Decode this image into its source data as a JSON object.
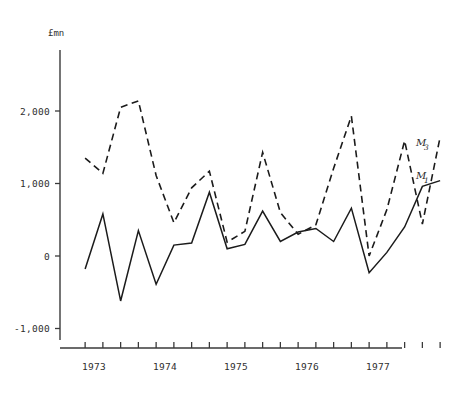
{
  "chart_data": {
    "type": "line",
    "title": "",
    "xlabel": "",
    "ylabel": "£mn",
    "unit_label": "£mn",
    "grid": false,
    "legend_position": "right-inline",
    "ylim": [
      -1000,
      2750
    ],
    "yticks": [
      -1000,
      0,
      1000,
      2000
    ],
    "ytick_labels": [
      "-1,000",
      "0",
      "1,000",
      "2,000"
    ],
    "xlim": [
      1972.75,
      1978.0
    ],
    "xtick_labels": [
      "1973",
      "1974",
      "1975",
      "1976",
      "1977"
    ],
    "xtick_values": [
      1973,
      1974,
      1975,
      1976,
      1977
    ],
    "x_minor_ticks_per_year": 4,
    "x": [
      1972.875,
      1973.125,
      1973.375,
      1973.625,
      1973.875,
      1974.125,
      1974.375,
      1974.625,
      1974.875,
      1975.125,
      1975.375,
      1975.625,
      1975.875,
      1976.125,
      1976.375,
      1976.625,
      1976.875,
      1977.125,
      1977.375,
      1977.625,
      1977.875
    ],
    "series": [
      {
        "name": "M1",
        "label": "M",
        "subscript": "1",
        "style": "solid",
        "color": "#1b1b1b",
        "values": [
          -180,
          580,
          -620,
          350,
          -390,
          150,
          180,
          880,
          100,
          160,
          620,
          200,
          330,
          380,
          200,
          660,
          -230,
          50,
          400,
          960,
          1040
        ]
      },
      {
        "name": "M3",
        "label": "M",
        "subscript": "3",
        "style": "dashed",
        "color": "#1b1b1b",
        "values": [
          1350,
          1140,
          2050,
          2140,
          1110,
          460,
          940,
          1170,
          190,
          340,
          1430,
          600,
          300,
          430,
          1210,
          1930,
          0,
          640,
          1590,
          440,
          1640
        ]
      }
    ]
  },
  "legend": {
    "entries": [
      {
        "label": "M",
        "subscript": "3"
      },
      {
        "label": "M",
        "subscript": "1"
      }
    ]
  }
}
